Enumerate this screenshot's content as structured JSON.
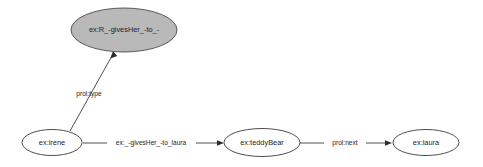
{
  "graph": {
    "type": "directed-graph",
    "background_color": "#ffffff",
    "node_stroke_color": "#3a3a3a",
    "node_fill_color": "#ffffff",
    "highlight_fill_color": "#b9b9b9",
    "text_color": "#1d1d1d",
    "nodes": [
      {
        "id": "statement",
        "label": "ex:R_-givesHer_-to_-",
        "shape": "ellipse",
        "filled": true,
        "cx": 124,
        "cy": 30,
        "rx": 53,
        "ry": 22
      },
      {
        "id": "irene",
        "label": "ex:irene",
        "shape": "ellipse",
        "filled": false,
        "cx": 52,
        "cy": 142,
        "rx": 30,
        "ry": 13
      },
      {
        "id": "teddybear",
        "label": "ex:teddyBear",
        "shape": "ellipse",
        "filled": false,
        "cx": 262,
        "cy": 142,
        "rx": 37,
        "ry": 14
      },
      {
        "id": "laura",
        "label": "ex:laura",
        "shape": "ellipse",
        "filled": false,
        "cx": 426,
        "cy": 142,
        "rx": 33,
        "ry": 13
      }
    ],
    "edges": [
      {
        "id": "edge-type",
        "from": "irene",
        "to": "statement",
        "label": "prol:type",
        "label_x": 89,
        "label_y": 94
      },
      {
        "id": "edge-givesher",
        "from": "irene",
        "to": "teddybear",
        "label": "ex:_-givesHer_-to_laura",
        "label_x": 151,
        "label_y": 143
      },
      {
        "id": "edge-next",
        "from": "teddybear",
        "to": "laura",
        "label": "prol:next",
        "label_x": 345,
        "label_y": 143
      }
    ]
  }
}
